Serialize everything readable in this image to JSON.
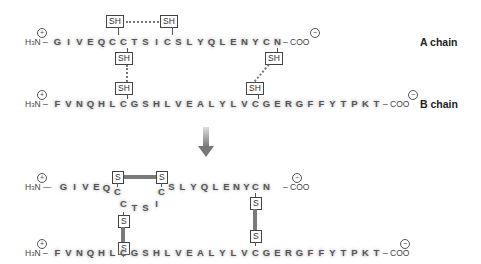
{
  "top_panel": {
    "a_chain": {
      "n_terminus": "H3N",
      "n_charge": "+",
      "c_terminus": "COO",
      "c_charge": "−",
      "sequence": [
        "G",
        "I",
        "V",
        "E",
        "Q",
        "C",
        "C",
        "T",
        "S",
        "I",
        "C",
        "S",
        "L",
        "Y",
        "Q",
        "L",
        "E",
        "N",
        "Y",
        "C",
        "N"
      ],
      "label": "A chain"
    },
    "b_chain": {
      "n_terminus": "H3N",
      "n_charge": "+",
      "c_terminus": "COO",
      "c_charge": "−",
      "sequence": [
        "F",
        "V",
        "N",
        "Q",
        "H",
        "L",
        "C",
        "G",
        "S",
        "H",
        "L",
        "V",
        "E",
        "A",
        "L",
        "Y",
        "L",
        "V",
        "C",
        "G",
        "E",
        "R",
        "G",
        "F",
        "F",
        "Y",
        "T",
        "P",
        "K",
        "T"
      ],
      "label": "B chain"
    },
    "sulfhydryl_label": "SH"
  },
  "arrow": "down-arrow",
  "bottom_panel": {
    "a_chain_left": [
      "G",
      "I",
      "V",
      "E",
      "Q",
      "C"
    ],
    "a_chain_loop": [
      "C",
      "T",
      "S",
      "I",
      "C"
    ],
    "a_chain_right": [
      "S",
      "L",
      "Y",
      "Q",
      "L",
      "E",
      "N",
      "Y",
      "C",
      "N"
    ],
    "b_chain": [
      "F",
      "V",
      "N",
      "Q",
      "H",
      "L",
      "C",
      "G",
      "S",
      "H",
      "L",
      "V",
      "E",
      "A",
      "L",
      "Y",
      "L",
      "V",
      "C",
      "G",
      "E",
      "R",
      "G",
      "F",
      "F",
      "Y",
      "T",
      "P",
      "K",
      "T"
    ],
    "sulfur_label": "S",
    "n_terminus": "H3N",
    "c_terminus": "COO"
  }
}
